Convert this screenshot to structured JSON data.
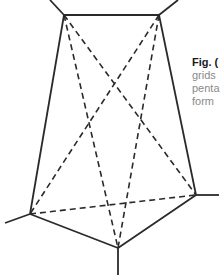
{
  "figure": {
    "stroke_color": "#2a2a2a",
    "vertices": {
      "top_left": [
        64,
        15
      ],
      "top_right": [
        159,
        15
      ],
      "right": [
        196,
        195
      ],
      "bottom": [
        118,
        248
      ],
      "bottom_left": [
        30,
        214
      ]
    },
    "edges_solid": [
      [
        "top_left",
        "top_right"
      ],
      [
        "top_right",
        "right"
      ],
      [
        "right",
        "bottom"
      ],
      [
        "bottom",
        "bottom_left"
      ],
      [
        "bottom_left",
        "top_left"
      ]
    ],
    "edges_dashed": [
      [
        "top_left",
        "bottom"
      ],
      [
        "top_left",
        "right"
      ],
      [
        "top_right",
        "bottom_left"
      ],
      [
        "top_right",
        "bottom"
      ],
      [
        "bottom_left",
        "right"
      ]
    ],
    "extensions": [
      [
        [
          64,
          15
        ],
        [
          50,
          0
        ]
      ],
      [
        [
          159,
          15
        ],
        [
          178,
          0
        ]
      ],
      [
        [
          196,
          195
        ],
        [
          219,
          195
        ]
      ],
      [
        [
          118,
          248
        ],
        [
          118,
          275
        ]
      ],
      [
        [
          30,
          214
        ],
        [
          5,
          223
        ]
      ]
    ]
  },
  "caption": {
    "label": "Fig. (",
    "lines": [
      "grids",
      "penta",
      "form"
    ]
  }
}
